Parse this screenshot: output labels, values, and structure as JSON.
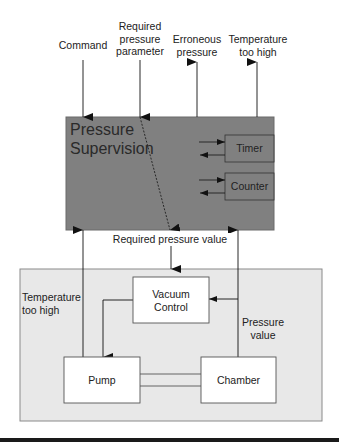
{
  "diagram": {
    "top_inputs": [
      {
        "id": "command",
        "label": "Command"
      },
      {
        "id": "required-pressure-parameter",
        "label": "Required pressure parameter",
        "lines": [
          "Required",
          "pressure",
          "parameter"
        ]
      }
    ],
    "top_outputs": [
      {
        "id": "erroneous-pressure",
        "label": "Erroneous pressure",
        "lines": [
          "Erroneous",
          "pressure"
        ]
      },
      {
        "id": "temperature-too-high-out",
        "label": "Temperature too high",
        "lines": [
          "Temperature",
          "too high"
        ]
      }
    ],
    "supervision_block": {
      "title_lines": [
        "Pressure",
        "Supervision"
      ],
      "fill": "#808080",
      "sub_blocks": [
        "Timer",
        "Counter"
      ]
    },
    "interface_label": "Required pressure value",
    "plant_block": {
      "fill": "#e8e8e8",
      "blocks": {
        "vacuum_control": [
          "Vacuum",
          "Control"
        ],
        "pump": "Pump",
        "chamber": "Chamber"
      },
      "labels": {
        "temperature": [
          "Temperature",
          "too high"
        ],
        "pressure_value": [
          "Pressure",
          "value"
        ]
      }
    }
  }
}
